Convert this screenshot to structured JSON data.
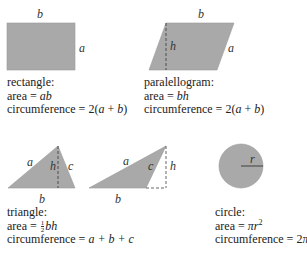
{
  "colors": {
    "fill": "#a9a9a9",
    "stroke": "#555555",
    "text": "#222222"
  },
  "shapes": {
    "rectangle": {
      "labels": {
        "top": "b",
        "side": "a"
      },
      "name": "rectangle:",
      "area_prefix": "area = ",
      "area_formula": "ab",
      "circ_prefix": "circumference = 2(",
      "circ_a": "a",
      "circ_plus": " + ",
      "circ_b": "b",
      "circ_suffix": ")"
    },
    "parallelogram": {
      "labels": {
        "top": "b",
        "side": "a",
        "height": "h"
      },
      "name": "paralellogram:",
      "area_prefix": "area = ",
      "area_formula": "bh",
      "circ_prefix": "circumference = 2(",
      "circ_a": "a",
      "circ_plus": " + ",
      "circ_b": "b",
      "circ_suffix": ")"
    },
    "triangle": {
      "labels_1": {
        "a": "a",
        "b": "b",
        "c": "c",
        "h": "h"
      },
      "labels_2": {
        "a": "a",
        "b": "b",
        "c": "c",
        "h": "h"
      },
      "name": "triangle:",
      "area_prefix": "area = ",
      "area_frac_num": "1",
      "area_frac_den": "2",
      "area_formula": "bh",
      "circ_prefix": "circumference = ",
      "circ_formula": "a + b + c"
    },
    "circle": {
      "labels": {
        "radius": "r"
      },
      "name": "circle:",
      "area_prefix": "area = ",
      "area_formula": "πr",
      "area_exp": "2",
      "circ_prefix": "circumference = 2",
      "circ_formula": "πr"
    }
  }
}
